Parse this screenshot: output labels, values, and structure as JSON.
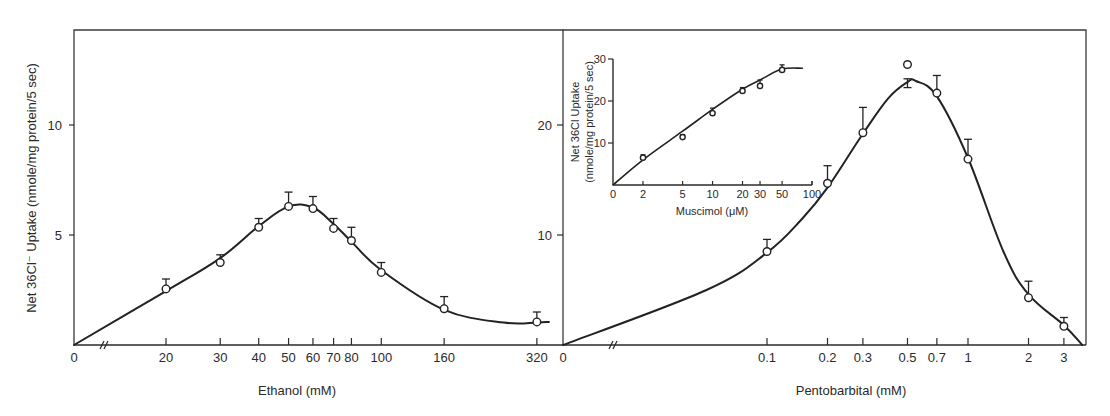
{
  "figure": {
    "shared_ylabel": "Net 36Cl⁻ Uptake (nmole/mg protein/5 sec)"
  },
  "chart_data": [
    {
      "id": "ethanol",
      "type": "line",
      "title": "",
      "xlabel": "Ethanol (mM)",
      "ylabel": "Net 36Cl⁻ Uptake (nmole/mg protein/5 sec)",
      "xscale": "log (with axis break after 0)",
      "xticks": [
        "0",
        "20",
        "30",
        "40",
        "50",
        "60",
        "70",
        "80",
        "100",
        "160",
        "320"
      ],
      "yticks": [
        "5",
        "10"
      ],
      "ylim": [
        0,
        14.3
      ],
      "grid": false,
      "legend": null,
      "series": [
        {
          "name": "Ethanol",
          "marker": "open-circle",
          "x": [
            20,
            30,
            40,
            50,
            60,
            70,
            80,
            100,
            160,
            320
          ],
          "y": [
            2.55,
            3.75,
            5.35,
            6.3,
            6.2,
            5.3,
            4.75,
            3.3,
            1.65,
            1.05
          ],
          "error_upper": [
            3.0,
            4.1,
            5.75,
            6.95,
            6.75,
            5.75,
            5.35,
            3.75,
            2.2,
            1.5
          ]
        }
      ],
      "fit_curve": {
        "x": [
          0,
          20,
          30,
          40,
          50,
          60,
          70,
          80,
          100,
          160,
          250,
          320,
          350
        ],
        "y": [
          0,
          2.45,
          3.95,
          5.4,
          6.3,
          6.25,
          5.5,
          4.7,
          3.4,
          1.6,
          1.02,
          1.02,
          1.05
        ]
      }
    },
    {
      "id": "pentobarbital",
      "type": "line",
      "title": "",
      "xlabel": "Pentobarbital (mM)",
      "ylabel": "Net 36Cl⁻ Uptake (nmole/mg protein/5 sec)",
      "xscale": "log (with axis break after 0)",
      "xticks": [
        "0",
        "0.1",
        "0.2",
        "0.3",
        "0.5",
        "0.7",
        "1",
        "2",
        "3"
      ],
      "yticks": [
        "10",
        "20"
      ],
      "ylim": [
        0,
        28.6
      ],
      "grid": false,
      "legend": null,
      "series": [
        {
          "name": "Pentobarbital",
          "marker": "open-circle",
          "x": [
            0.1,
            0.2,
            0.3,
            0.5,
            0.7,
            1,
            2,
            3
          ],
          "y": [
            8.5,
            14.7,
            19.3,
            25.5,
            22.9,
            16.9,
            4.3,
            1.7
          ],
          "error_upper": [
            9.6,
            16.3,
            21.6,
            24.2,
            24.5,
            18.7,
            5.8,
            2.5
          ],
          "error_lower": [
            null,
            null,
            null,
            23.4,
            null,
            null,
            null,
            null
          ]
        }
      ],
      "fit_curve": {
        "x": [
          0,
          0.05,
          0.1,
          0.15,
          0.2,
          0.3,
          0.4,
          0.5,
          0.55,
          0.7,
          1,
          1.5,
          2,
          3,
          3.7
        ],
        "y": [
          0,
          5.0,
          8.4,
          11.5,
          14.3,
          19.2,
          22.4,
          23.9,
          24.0,
          22.6,
          17.0,
          8.5,
          4.6,
          1.8,
          0
        ]
      }
    },
    {
      "id": "muscimol-inset",
      "type": "line",
      "title": "",
      "xlabel": "Muscimol (μM)",
      "ylabel": "Net 36Cl Uptake (nmole/mg protein/5 sec)",
      "xscale": "log (with 0 at origin)",
      "xticks": [
        "0",
        "2",
        "5",
        "10",
        "20",
        "30",
        "50",
        "100"
      ],
      "yticks": [
        "10",
        "20",
        "30"
      ],
      "ylim": [
        0,
        30
      ],
      "grid": false,
      "legend": null,
      "series": [
        {
          "name": "Muscimol",
          "marker": "open-circle",
          "x": [
            0,
            2,
            5,
            10,
            20,
            30,
            50
          ],
          "y": [
            0,
            6.5,
            11.4,
            17.1,
            22.4,
            23.6,
            27.4
          ],
          "error_upper": [
            null,
            7.2,
            12.0,
            18.3,
            23.2,
            25.0,
            28.6
          ]
        }
      ],
      "fit_curve": {
        "x": [
          0,
          2,
          5,
          10,
          20,
          30,
          50,
          80
        ],
        "y": [
          0,
          6.0,
          12.8,
          18.0,
          22.8,
          25.0,
          27.6,
          27.8
        ]
      }
    }
  ]
}
